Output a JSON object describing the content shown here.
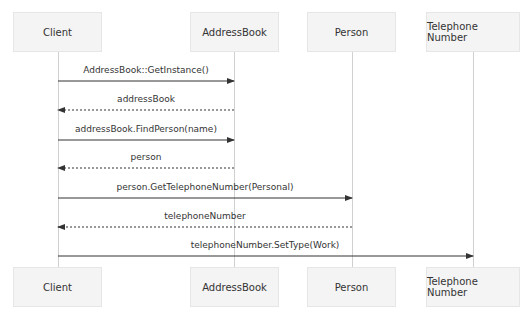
{
  "diagram": {
    "type": "sequence",
    "participants": [
      {
        "name": "Client",
        "x": 13,
        "w": 89,
        "cx": 58
      },
      {
        "name": "AddressBook",
        "x": 190,
        "w": 89,
        "cx": 234
      },
      {
        "name": "Person",
        "x": 307,
        "w": 89,
        "cx": 352
      },
      {
        "name": "Telephone Number",
        "x": 426,
        "w": 94,
        "cx": 473
      }
    ],
    "messages": [
      {
        "label": "AddressBook::GetInstance()",
        "from": 0,
        "to": 1,
        "style": "solid",
        "y": 81
      },
      {
        "label": "addressBook",
        "from": 1,
        "to": 0,
        "style": "dashed",
        "y": 110
      },
      {
        "label": "addressBook.FindPerson(name)",
        "from": 0,
        "to": 1,
        "style": "solid",
        "y": 140
      },
      {
        "label": "person",
        "from": 1,
        "to": 0,
        "style": "dashed",
        "y": 168
      },
      {
        "label": "person.GetTelephoneNumber(Personal)",
        "from": 0,
        "to": 2,
        "style": "solid",
        "y": 198
      },
      {
        "label": "telephoneNumber",
        "from": 2,
        "to": 0,
        "style": "dashed",
        "y": 227
      },
      {
        "label": "telephoneNumber.SetType(Work)",
        "from": 0,
        "to": 3,
        "style": "solid",
        "y": 256
      }
    ]
  }
}
